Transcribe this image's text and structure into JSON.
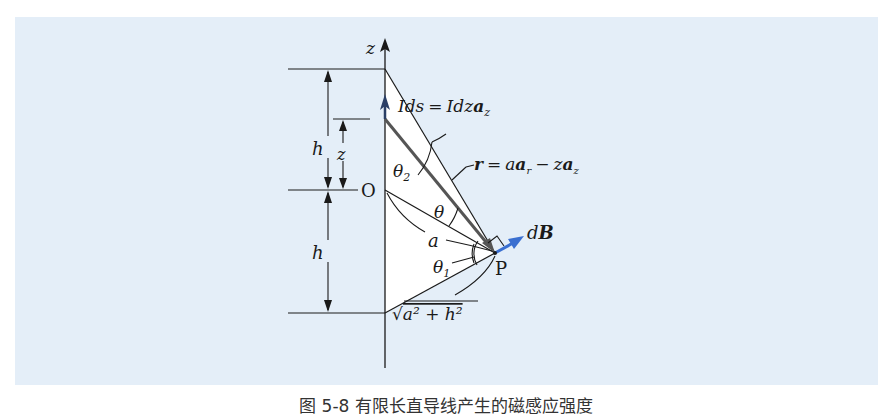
{
  "figure": {
    "labels": {
      "z_axis": "z",
      "origin": "O",
      "point": "P",
      "h_top": "h",
      "h_bottom": "h",
      "z_dim": "z",
      "current_element": {
        "lhs": "Ids",
        "eq": "=",
        "rhs": "Idz",
        "vec": "a",
        "sub": "z"
      },
      "r_vector": {
        "r": "r",
        "eq": "=",
        "a": "a",
        "ar": "a",
        "ar_sub": "r",
        "minus": "−",
        "z": "z",
        "az": "a",
        "az_sub": "z"
      },
      "theta2": "θ",
      "theta2_sub": "2",
      "theta": "θ",
      "theta1": "θ",
      "theta1_sub": "1",
      "a_dist": "a",
      "hyp": "a² + h²",
      "dB": "d",
      "dB_vec": "B"
    },
    "colors": {
      "panel_bg": "#e4eef8",
      "triangle_fill": "#ffffff",
      "line": "#1a1a1a",
      "r_line": "#555555",
      "current_arrow": "#2b3f66",
      "dB_arrow": "#3a6fd0"
    }
  },
  "caption": "图 5-8  有限长直导线产生的磁感应强度"
}
